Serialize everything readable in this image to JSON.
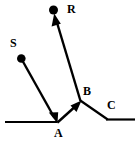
{
  "figure": {
    "stroke_color": "#000000",
    "background_color": "#ffffff",
    "labels": {
      "source": "S",
      "reflected": "R",
      "point_a": "A",
      "point_b": "B",
      "point_c": "C"
    },
    "points": {
      "source_dot": {
        "x": 21,
        "y": 58,
        "r": 4.2
      },
      "reflected_dot": {
        "x": 53.5,
        "y": 10,
        "r": 4.2
      },
      "vertex_a": {
        "x": 57,
        "y": 122
      },
      "vertex_b": {
        "x": 80.5,
        "y": 100.5
      },
      "bend_c": {
        "x": 107,
        "y": 119
      },
      "surface_left_start": {
        "x": 5,
        "y": 122
      },
      "surface_right_end": {
        "x": 135,
        "y": 119
      }
    },
    "rays": [
      {
        "name": "incident-ray-s-to-a",
        "from": "S",
        "to": "A",
        "arrow": true
      },
      {
        "name": "ray-a-to-b",
        "from": "A",
        "to": "B",
        "arrow": true
      },
      {
        "name": "reflected-ray-b-to-r",
        "from": "B",
        "to": "R",
        "arrow": true
      }
    ],
    "mirrors": [
      {
        "name": "mirror-surface-left",
        "from": "surface_left_start",
        "to": "vertex_a"
      },
      {
        "name": "mirror-surface-right",
        "from": "vertex_b",
        "to": "bend_c"
      },
      {
        "name": "mirror-surface-base-right",
        "from": "bend_c",
        "to": "surface_right_end"
      }
    ]
  }
}
